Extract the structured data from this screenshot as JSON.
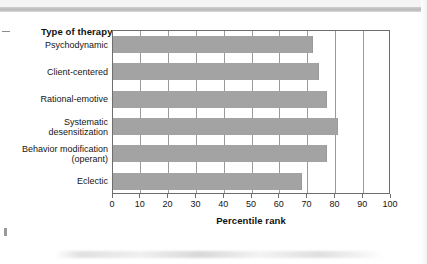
{
  "figure": {
    "y_axis_title": "Type of therapy",
    "x_axis_title": "Percentile rank"
  },
  "chart_data": {
    "type": "bar",
    "orientation": "horizontal",
    "title": "",
    "xlabel": "Percentile rank",
    "ylabel": "Type of therapy",
    "xlim": [
      0,
      100
    ],
    "xticks": [
      "0",
      "10",
      "20",
      "30",
      "40",
      "50",
      "60",
      "70",
      "80",
      "90",
      "100"
    ],
    "grid": "vertical",
    "legend": "none",
    "bar_color": "#a3a3a3",
    "categories": [
      "Psychodynamic",
      "Client-centered",
      "Rational-emotive",
      "Systematic\ndesensitization",
      "Behavior modification\n(operant)",
      "Eclectic"
    ],
    "values": [
      72,
      74,
      77,
      81,
      77,
      68
    ],
    "bars": [
      {
        "label_line1": "Psychodynamic",
        "label_line2": "",
        "value": 72
      },
      {
        "label_line1": "Client-centered",
        "label_line2": "",
        "value": 74
      },
      {
        "label_line1": "Rational-emotive",
        "label_line2": "",
        "value": 77
      },
      {
        "label_line1": "Systematic",
        "label_line2": "desensitization",
        "value": 81
      },
      {
        "label_line1": "Behavior modification",
        "label_line2": "(operant)",
        "value": 77
      },
      {
        "label_line1": "Eclectic",
        "label_line2": "",
        "value": 68
      }
    ]
  }
}
